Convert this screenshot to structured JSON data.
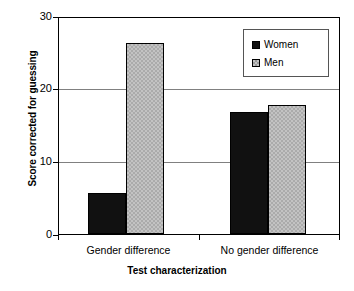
{
  "chart_data": {
    "type": "bar",
    "title": "",
    "xlabel": "Test characterization",
    "ylabel": "Score corrected for guessing",
    "categories": [
      "Gender difference",
      "No gender difference"
    ],
    "series": [
      {
        "name": "Women",
        "color": "#111111",
        "values": [
          5.7,
          17.0
        ]
      },
      {
        "name": "Men",
        "color": "#c3c3c3",
        "values": [
          26.5,
          17.9
        ]
      }
    ],
    "ylim": [
      0,
      30
    ],
    "yticks": [
      0,
      10,
      20,
      30
    ],
    "ytick_labels": [
      "0",
      "10",
      "20",
      "30"
    ],
    "grid": true,
    "legend_position": "top-right"
  },
  "axes": {
    "y_title": "Score corrected for guessing",
    "x_title": "Test characterization",
    "y_tick_0": "0",
    "y_tick_1": "10",
    "y_tick_2": "20",
    "y_tick_3": "30"
  },
  "legend": {
    "items": [
      {
        "label": "Women",
        "swatch": "black-square-swatch"
      },
      {
        "label": "Men",
        "swatch": "gray-hatched-square-swatch"
      }
    ]
  },
  "x_categories": {
    "group_0": "Gender difference",
    "group_1": "No gender difference"
  }
}
